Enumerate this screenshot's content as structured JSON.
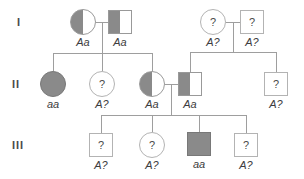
{
  "diagram": {
    "colors": {
      "fill_gray": "#8a8a8a",
      "shape_border": "#b3b3b3",
      "filled_border": "#787878",
      "line": "#9e9e9e",
      "text": "#3d3d3d"
    },
    "generations": [
      {
        "label": "I"
      },
      {
        "label": "II"
      },
      {
        "label": "III"
      }
    ],
    "individuals": [
      {
        "id": "I-1",
        "generation": "I",
        "sex": "female",
        "fill": "half",
        "symbol_text": "",
        "genotype": "Aa",
        "css": "pshape circle half"
      },
      {
        "id": "I-2",
        "generation": "I",
        "sex": "male",
        "fill": "half",
        "symbol_text": "",
        "genotype": "Aa",
        "css": "pshape square half"
      },
      {
        "id": "I-3",
        "generation": "I",
        "sex": "female",
        "fill": "none",
        "symbol_text": "?",
        "genotype": "A?",
        "css": "pshape circle"
      },
      {
        "id": "I-4",
        "generation": "I",
        "sex": "male",
        "fill": "none",
        "symbol_text": "?",
        "genotype": "A?",
        "css": "pshape square"
      },
      {
        "id": "II-1",
        "generation": "II",
        "sex": "female",
        "fill": "full",
        "symbol_text": "",
        "genotype": "aa",
        "css": "pshape circle full"
      },
      {
        "id": "II-2",
        "generation": "II",
        "sex": "female",
        "fill": "none",
        "symbol_text": "?",
        "genotype": "A?",
        "css": "pshape circle"
      },
      {
        "id": "II-3",
        "generation": "II",
        "sex": "female",
        "fill": "half",
        "symbol_text": "",
        "genotype": "Aa",
        "css": "pshape circle half"
      },
      {
        "id": "II-4",
        "generation": "II",
        "sex": "male",
        "fill": "half",
        "symbol_text": "",
        "genotype": "Aa",
        "css": "pshape square half"
      },
      {
        "id": "II-5",
        "generation": "II",
        "sex": "male",
        "fill": "none",
        "symbol_text": "?",
        "genotype": "A?",
        "css": "pshape square"
      },
      {
        "id": "III-1",
        "generation": "III",
        "sex": "male",
        "fill": "none",
        "symbol_text": "?",
        "genotype": "A?",
        "css": "pshape square"
      },
      {
        "id": "III-2",
        "generation": "III",
        "sex": "female",
        "fill": "none",
        "symbol_text": "?",
        "genotype": "A?",
        "css": "pshape circle"
      },
      {
        "id": "III-3",
        "generation": "III",
        "sex": "male",
        "fill": "full",
        "symbol_text": "",
        "genotype": "aa",
        "css": "pshape square full"
      },
      {
        "id": "III-4",
        "generation": "III",
        "sex": "male",
        "fill": "none",
        "symbol_text": "?",
        "genotype": "A?",
        "css": "pshape square"
      }
    ]
  }
}
